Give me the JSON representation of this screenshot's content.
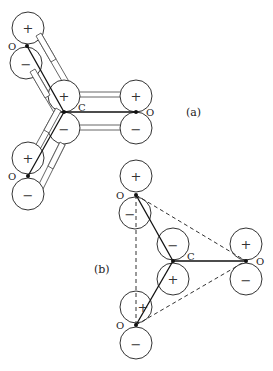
{
  "figure": {
    "panel_a": {
      "label": "(a)",
      "atoms": [
        {
          "id": "O_top",
          "symbol": "O",
          "lobes": [
            "+",
            "−"
          ]
        },
        {
          "id": "C",
          "symbol": "C",
          "lobes": [
            "+",
            "−"
          ]
        },
        {
          "id": "O_right",
          "symbol": "O",
          "lobes": [
            "+",
            "−"
          ]
        },
        {
          "id": "O_bottom",
          "symbol": "O",
          "lobes": [
            "+",
            "−"
          ]
        }
      ]
    },
    "panel_b": {
      "label": "(b)",
      "atoms": [
        {
          "id": "O_top",
          "symbol": "O",
          "lobes": [
            "+",
            "−"
          ]
        },
        {
          "id": "C",
          "symbol": "C",
          "lobes": [
            "−",
            "+"
          ]
        },
        {
          "id": "O_right",
          "symbol": "O",
          "lobes": [
            "+",
            "−"
          ]
        },
        {
          "id": "O_bottom",
          "symbol": "O",
          "lobes": [
            "+",
            "−"
          ]
        }
      ]
    },
    "colors": {
      "line": "#222222",
      "bond_fill": "#ffffff",
      "background": "#ffffff"
    }
  }
}
